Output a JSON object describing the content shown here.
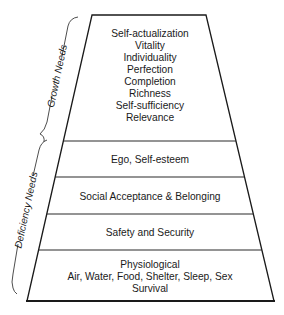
{
  "diagram": {
    "side_labels": {
      "growth": "Growth Needs",
      "deficiency": "Deficiency Needs"
    },
    "levels": [
      {
        "name": "growth",
        "lines": [
          "Self-actualization",
          "Vitality",
          "Individuality",
          "Perfection",
          "Completion",
          "Richness",
          "Self-sufficiency",
          "Relevance"
        ]
      },
      {
        "name": "ego",
        "lines": [
          "Ego, Self-esteem"
        ]
      },
      {
        "name": "social",
        "lines": [
          "Social Acceptance & Belonging"
        ]
      },
      {
        "name": "safety",
        "lines": [
          "Safety and Security"
        ]
      },
      {
        "name": "physiological",
        "lines": [
          "Physiological",
          "Air, Water, Food, Shelter, Sleep, Sex",
          "Survival"
        ]
      }
    ],
    "colors": {
      "line": "#1a1a1a",
      "background": "#ffffff"
    }
  }
}
